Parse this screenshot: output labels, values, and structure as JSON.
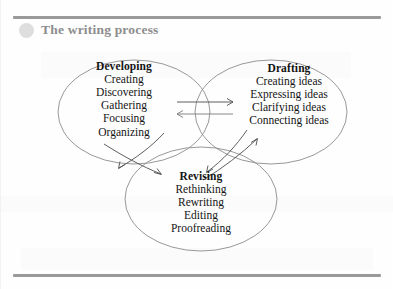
{
  "slide": {
    "title": "The writing process",
    "bullet_icon": "circle-bullet-icon",
    "rule_color": "#9a9a9a",
    "title_color": "#8d8d8d",
    "background_color": "#ffffff"
  },
  "diagram": {
    "type": "venn-three-circle",
    "outline_color": "#8c8c8c",
    "arrow_color": "#4c4c4c",
    "circles": [
      {
        "id": "developing",
        "heading": "Developing",
        "position": "top-left",
        "items": [
          "Creating",
          "Discovering",
          "Gathering",
          "Focusing",
          "Organizing"
        ]
      },
      {
        "id": "drafting",
        "heading": "Drafting",
        "position": "top-right",
        "items": [
          "Creating ideas",
          "Expressing ideas",
          "Clarifying ideas",
          "Connecting ideas"
        ]
      },
      {
        "id": "revising",
        "heading": "Revising",
        "position": "bottom-center",
        "items": [
          "Rethinking",
          "Rewriting",
          "Editing",
          "Proofreading"
        ]
      }
    ],
    "connectors": [
      {
        "id": "developing-drafting",
        "style": "bidirectional-horizontal-pair"
      },
      {
        "id": "developing-revising",
        "style": "bidirectional-crossing-pair"
      },
      {
        "id": "drafting-revising",
        "style": "bidirectional-crossing-pair"
      }
    ]
  }
}
